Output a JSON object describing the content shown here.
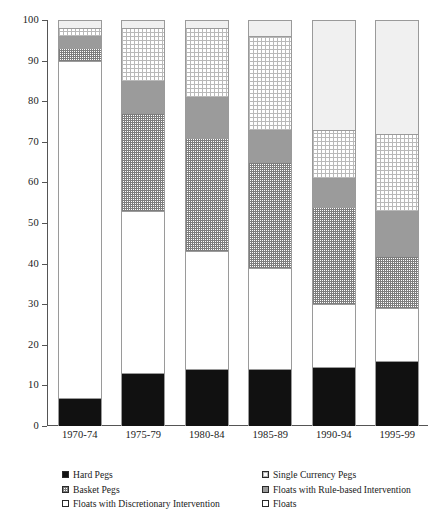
{
  "chart_data": {
    "type": "bar",
    "title": "",
    "subtitle": "",
    "xlabel": "",
    "ylabel": "",
    "stacked": true,
    "grid": false,
    "legend_position": "bottom",
    "ylim": [
      0,
      100
    ],
    "yticks": [
      0,
      10,
      20,
      30,
      40,
      50,
      60,
      70,
      80,
      90,
      100
    ],
    "ytick_labels": [
      "0",
      "10",
      "20",
      "30",
      "40",
      "50",
      "60",
      "70",
      "80",
      "90",
      "100"
    ],
    "categories": [
      "1970-74",
      "1975-79",
      "1980-84",
      "1985-89",
      "1990-94",
      "1995-99"
    ],
    "series": [
      {
        "name": "Hard Pegs",
        "key": "hard",
        "fill": "solid-black",
        "color": "#111111",
        "values": [
          7,
          13,
          14,
          14,
          14.5,
          16
        ]
      },
      {
        "name": "Floats with  Discretionary Intervention",
        "key": "floatsdisc",
        "fill": "white",
        "color": "#ffffff",
        "values": [
          83,
          40,
          29,
          25,
          15.5,
          13
        ]
      },
      {
        "name": "Basket Pegs",
        "key": "basket",
        "fill": "dense-grid-hatch",
        "color": "#7d7d7d",
        "values": [
          3,
          24,
          28,
          26,
          24,
          13
        ]
      },
      {
        "name": "Floats with Rule-based Intervention",
        "key": "rule",
        "fill": "solid-gray",
        "color": "#9b9b9b",
        "values": [
          3,
          8,
          10,
          8,
          7,
          11
        ]
      },
      {
        "name": "Single Currency Pegs",
        "key": "single",
        "fill": "sparse-dot-hatch",
        "color": "#b9b9b9",
        "values": [
          2,
          13,
          17,
          23,
          12,
          19
        ]
      },
      {
        "name": "Floats",
        "key": "floats",
        "fill": "light-gray",
        "color": "#f0f0f0",
        "values": [
          2,
          2,
          2,
          4,
          27,
          28
        ]
      }
    ],
    "totals": [
      100,
      100,
      100,
      100,
      100,
      100
    ]
  },
  "legend": {
    "items": [
      {
        "label": "Hard Pegs",
        "key": "hard"
      },
      {
        "label": "Single Currency Pegs",
        "key": "single"
      },
      {
        "label": "Basket Pegs",
        "key": "basket"
      },
      {
        "label": "Floats with Rule-based Intervention",
        "key": "rule"
      },
      {
        "label": "Floats with  Discretionary Intervention",
        "key": "floatsdisc"
      },
      {
        "label": "Floats",
        "key": "floats"
      }
    ]
  }
}
